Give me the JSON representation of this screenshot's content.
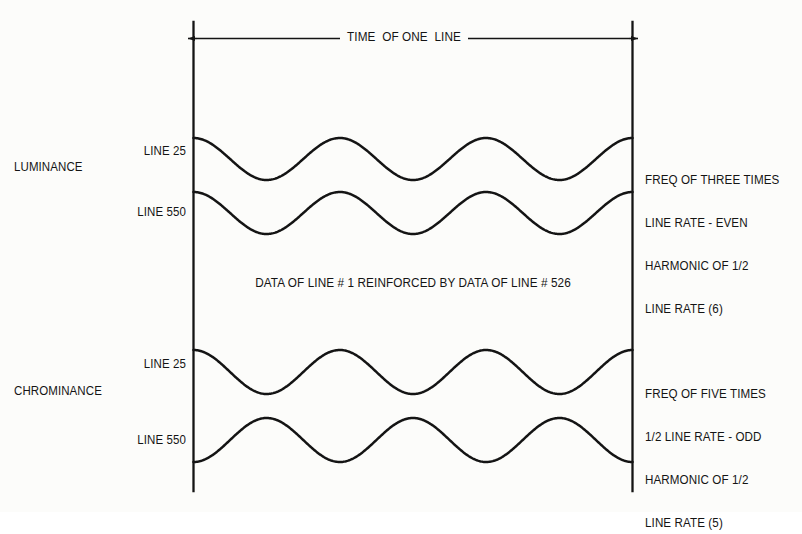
{
  "figure": {
    "background_color": "#fcfcfa",
    "ink_color": "#141414"
  },
  "dimension": {
    "label": "TIME  OF ONE  LINE",
    "left_marker": "left-line-boundary",
    "right_marker": "right-line-boundary"
  },
  "groups": [
    {
      "name": "LUMINANCE",
      "traces": [
        {
          "label": "LINE 25",
          "cycles": 3,
          "phase": "peak"
        },
        {
          "label": "LINE 550",
          "cycles": 3,
          "phase": "peak"
        }
      ],
      "note_lines": [
        "FREQ OF THREE TIMES",
        "LINE RATE - EVEN",
        "HARMONIC OF 1/2",
        "LINE RATE (6)"
      ]
    },
    {
      "name": "CHROMINANCE",
      "traces": [
        {
          "label": "LINE 25",
          "cycles": 3,
          "phase": "peak"
        },
        {
          "label": "LINE 550",
          "cycles": 3,
          "phase": "trough"
        }
      ],
      "note_lines": [
        "FREQ OF FIVE TIMES",
        "1/2 LINE RATE - ODD",
        "HARMONIC OF 1/2",
        "LINE RATE (5)"
      ]
    }
  ],
  "center_note": "DATA OF LINE # 1 REINFORCED BY DATA OF LINE # 526",
  "chart_data": {
    "type": "line",
    "xlabel": "TIME  OF ONE  LINE",
    "ylabel": "",
    "x": [
      0,
      1
    ],
    "xlim": [
      0,
      1
    ],
    "grid": false,
    "legend": "none",
    "annotations": [
      "DATA OF LINE # 1 REINFORCED BY DATA OF LINE # 526",
      "FREQ OF THREE TIMES LINE RATE - EVEN HARMONIC OF 1/2 LINE RATE (6)",
      "FREQ OF FIVE TIMES 1/2 LINE RATE - ODD HARMONIC OF 1/2 LINE RATE (5)"
    ],
    "series": [
      {
        "name": "LUMINANCE LINE 25",
        "group": "LUMINANCE",
        "cycles_per_line": 3,
        "phase_deg": 0,
        "amplitude": 1,
        "baseline_y_px": 159,
        "amplitude_px": 21
      },
      {
        "name": "LUMINANCE LINE 550",
        "group": "LUMINANCE",
        "cycles_per_line": 3,
        "phase_deg": 0,
        "amplitude": 1,
        "baseline_y_px": 213,
        "amplitude_px": 21
      },
      {
        "name": "CHROMINANCE LINE 25",
        "group": "CHROMINANCE",
        "cycles_per_line": 3,
        "phase_deg": 0,
        "amplitude": 1,
        "baseline_y_px": 372,
        "amplitude_px": 22
      },
      {
        "name": "CHROMINANCE LINE 550",
        "group": "CHROMINANCE",
        "cycles_per_line": 3,
        "phase_deg": 180,
        "amplitude": 1,
        "baseline_y_px": 440,
        "amplitude_px": 22
      }
    ]
  }
}
